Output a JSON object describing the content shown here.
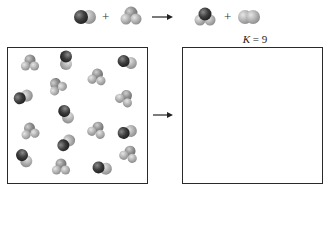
{
  "equation": {
    "reactant_1": {
      "name": "CO",
      "icon": "diatomic-dark-light-molecule-icon"
    },
    "plus_1": "+",
    "reactant_2": {
      "name": "H2O",
      "icon": "triatomic-gray-molecule-icon"
    },
    "arrow": "→",
    "product_1": {
      "name": "CO2-like",
      "icon": "triatomic-dark-center-molecule-icon"
    },
    "plus_2": "+",
    "product_2": {
      "name": "H2",
      "icon": "diatomic-light-molecule-icon"
    }
  },
  "equilibrium": {
    "k_symbol": "K",
    "k_equals": " = 9"
  },
  "left_box": {
    "label": "initial mixture",
    "molecules": [
      {
        "type": "tri",
        "x": 30,
        "y": 63,
        "rot": 0
      },
      {
        "type": "di",
        "x": 66,
        "y": 60,
        "rot": 90
      },
      {
        "type": "di",
        "x": 127,
        "y": 62,
        "rot": 15
      },
      {
        "type": "tri",
        "x": 97,
        "y": 77,
        "rot": 10
      },
      {
        "type": "tri",
        "x": 57,
        "y": 86,
        "rot": -30
      },
      {
        "type": "di",
        "x": 23,
        "y": 97,
        "rot": -20
      },
      {
        "type": "tri",
        "x": 125,
        "y": 98,
        "rot": 30
      },
      {
        "type": "di",
        "x": 66,
        "y": 114,
        "rot": 60
      },
      {
        "type": "tri",
        "x": 30,
        "y": 131,
        "rot": -10
      },
      {
        "type": "tri",
        "x": 97,
        "y": 130,
        "rot": 20
      },
      {
        "type": "di",
        "x": 127,
        "y": 132,
        "rot": -15
      },
      {
        "type": "di",
        "x": 66,
        "y": 143,
        "rot": -40
      },
      {
        "type": "di",
        "x": 24,
        "y": 158,
        "rot": 55
      },
      {
        "type": "tri",
        "x": 61,
        "y": 167,
        "rot": 0
      },
      {
        "type": "di",
        "x": 102,
        "y": 168,
        "rot": 10
      },
      {
        "type": "tri",
        "x": 129,
        "y": 154,
        "rot": 20
      }
    ]
  },
  "right_box": {
    "label": "equilibrium mixture (empty)",
    "molecules": []
  },
  "middle_arrow": "→",
  "colors": {
    "dark_atom": "#3a3a3a",
    "mid_atom": "#8a8a8a",
    "light_atom": "#b5b5b5",
    "box_border": "#2a2a2a"
  }
}
